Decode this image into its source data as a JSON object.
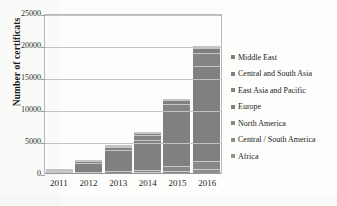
{
  "chart_data": {
    "type": "bar",
    "stacked": true,
    "title": "",
    "xlabel": "",
    "ylabel": "Number of certificats",
    "categories": [
      "2011",
      "2012",
      "2013",
      "2014",
      "2015",
      "2016"
    ],
    "ylim": [
      0,
      25000
    ],
    "yticks": [
      "25000",
      "20000",
      "15000",
      "10000",
      "5000",
      "0"
    ],
    "ytick_values": [
      25000,
      20000,
      15000,
      10000,
      5000,
      0
    ],
    "grid": true,
    "legend_position": "right",
    "series": [
      {
        "name": "Africa",
        "color": "#939393",
        "values": [
          10,
          40,
          70,
          110,
          180,
          300
        ]
      },
      {
        "name": "Central / South America",
        "color": "#8d8d8d",
        "values": [
          10,
          60,
          120,
          180,
          320,
          550
        ]
      },
      {
        "name": "North America",
        "color": "#888888",
        "values": [
          20,
          120,
          250,
          380,
          700,
          1200
        ]
      },
      {
        "name": "Europe",
        "color": "#808080",
        "values": [
          150,
          1450,
          3300,
          4700,
          8600,
          14800
        ]
      },
      {
        "name": "East Asia and Pacific",
        "color": "#848484",
        "values": [
          40,
          230,
          500,
          750,
          1200,
          2000
        ]
      },
      {
        "name": "Central and South Asia",
        "color": "#7f7f7f",
        "values": [
          15,
          80,
          180,
          280,
          500,
          850
        ]
      },
      {
        "name": "Middle East",
        "color": "#7b7b7b",
        "values": [
          5,
          20,
          80,
          100,
          200,
          300
        ]
      }
    ],
    "totals": [
      250,
      2000,
      4500,
      6500,
      11700,
      20000
    ]
  },
  "legend": {
    "items": [
      {
        "label": "Middle East"
      },
      {
        "label": "Central and South Asia"
      },
      {
        "label": "East Asia and Pacific"
      },
      {
        "label": "Europe"
      },
      {
        "label": "North America"
      },
      {
        "label": "Central / South America"
      },
      {
        "label": "Africa"
      }
    ]
  }
}
